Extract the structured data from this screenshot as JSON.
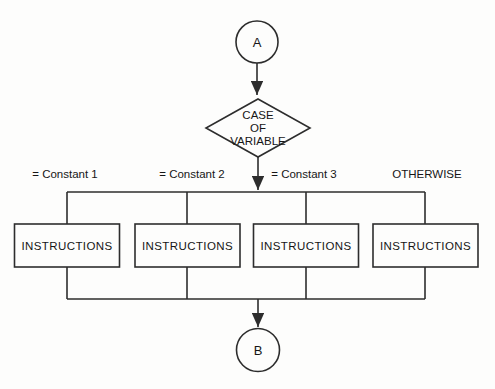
{
  "diagram": {
    "type": "flowchart-case-statement",
    "start_connector": {
      "label": "A"
    },
    "decision": {
      "label_lines": [
        "CASE",
        "OF",
        "VARIABLE"
      ]
    },
    "branches": [
      {
        "condition": "= Constant 1",
        "box": "INSTRUCTIONS"
      },
      {
        "condition": "= Constant 2",
        "box": "INSTRUCTIONS"
      },
      {
        "condition": "= Constant 3",
        "box": "INSTRUCTIONS"
      },
      {
        "condition": "OTHERWISE",
        "box": "INSTRUCTIONS"
      }
    ],
    "end_connector": {
      "label": "B"
    },
    "colors": {
      "line": "#2d2d2d",
      "text": "#161616",
      "background": "#fdfdfc"
    }
  }
}
